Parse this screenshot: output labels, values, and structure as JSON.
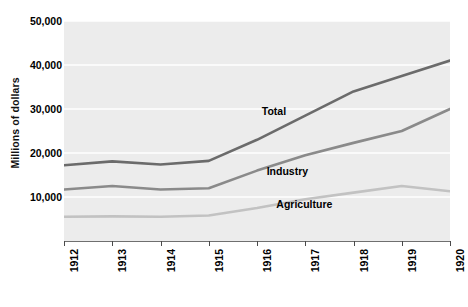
{
  "chart_data": {
    "type": "line",
    "title": "",
    "subtitle": "",
    "xlabel": "",
    "ylabel": "Millions of dollars",
    "x": [
      1912,
      1913,
      1914,
      1915,
      1916,
      1917,
      1918,
      1919,
      1920
    ],
    "xtick_labels": [
      "1912",
      "1913",
      "1914",
      "1915",
      "1916",
      "1917",
      "1918",
      "1919",
      "1920"
    ],
    "ytick_labels": [
      "10,000",
      "20,000",
      "30,000",
      "40,000",
      "50,000"
    ],
    "ytick_values": [
      10000,
      20000,
      30000,
      40000,
      50000
    ],
    "ylim": [
      0,
      50000
    ],
    "xlim": [
      1912,
      1920
    ],
    "grid": "horizontal-white-gridlines",
    "legend_position": "inline-labels-on-plot",
    "plot_background": "#ececec",
    "series": [
      {
        "name": "Total",
        "color": "#6b6b6b",
        "values": [
          17200,
          18100,
          17400,
          18200,
          23000,
          28500,
          34000,
          37500,
          41000
        ],
        "label_x": 1916.1,
        "label_y": 29300
      },
      {
        "name": "Industry",
        "color": "#8a8a8a",
        "values": [
          11700,
          12500,
          11700,
          12000,
          16000,
          19500,
          22300,
          25000,
          30000
        ],
        "label_x": 1916.2,
        "label_y": 15600
      },
      {
        "name": "Agriculture",
        "color": "#c2c2c2",
        "values": [
          5500,
          5600,
          5500,
          5800,
          7500,
          9500,
          11000,
          12500,
          11300
        ],
        "label_x": 1916.4,
        "label_y": 8200
      }
    ]
  },
  "colors": {
    "total": "#6b6b6b",
    "industry": "#8a8a8a",
    "agriculture": "#c2c2c2",
    "plot_bg": "#ececec",
    "gridline": "#ffffff",
    "axis": "#6f6f6f",
    "text": "#000000"
  }
}
